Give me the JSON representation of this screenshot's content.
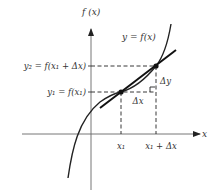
{
  "diagram": {
    "axes": {
      "y_label": "f (x)",
      "x_label": "x"
    },
    "curve_label": "y = f(x)",
    "y_labels": {
      "y2": "y₂ = f(x₁ + Δx)",
      "y1": "y₁ = f(x₁)"
    },
    "x_labels": {
      "x1": "x₁",
      "x1_plus_dx": "x₁ + Δx"
    },
    "increments": {
      "delta_x": "Δx",
      "delta_y": "Δy"
    },
    "colors": {
      "line": "#222222",
      "axis": "#555555",
      "background": "#ffffff"
    }
  }
}
